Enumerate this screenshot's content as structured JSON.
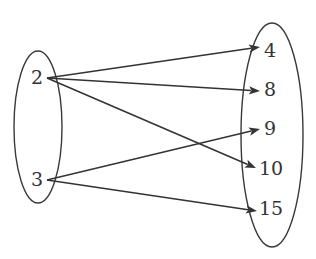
{
  "diagram": {
    "type": "mapping-diagram",
    "domain_set": {
      "name": "domain",
      "elements": [
        "2",
        "3"
      ]
    },
    "codomain_set": {
      "name": "codomain",
      "elements": [
        "4",
        "8",
        "9",
        "10",
        "15"
      ]
    },
    "mappings": [
      {
        "from": "2",
        "to": "4"
      },
      {
        "from": "2",
        "to": "8"
      },
      {
        "from": "2",
        "to": "10"
      },
      {
        "from": "3",
        "to": "9"
      },
      {
        "from": "3",
        "to": "15"
      }
    ],
    "colors": {
      "stroke": "#333333",
      "background": "#ffffff"
    }
  }
}
